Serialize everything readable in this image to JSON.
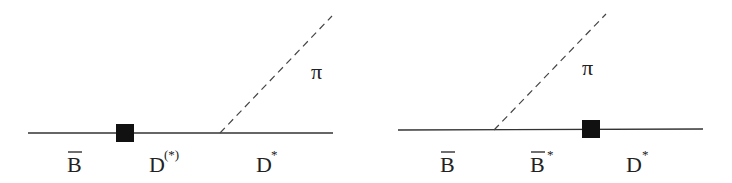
{
  "diagrams": [
    {
      "id": "left",
      "line": {
        "x1": 28,
        "x2": 333,
        "y": 133
      },
      "vertex": {
        "cx": 125,
        "cy": 133,
        "size": 18
      },
      "dashed": {
        "x1": 220,
        "y1": 133,
        "x2": 332,
        "y2": 16
      },
      "labels": {
        "pion": "π",
        "incoming": {
          "base": "B",
          "bar": true
        },
        "intermediate": {
          "base": "D",
          "sup": "(*)"
        },
        "outgoing": {
          "base": "D",
          "sup": "*"
        }
      }
    },
    {
      "id": "right",
      "line": {
        "x1": 398,
        "x2": 703,
        "y": 130
      },
      "vertex": {
        "cx": 591,
        "cy": 129,
        "size": 18
      },
      "dashed": {
        "x1": 494,
        "y1": 130,
        "x2": 606,
        "y2": 14
      },
      "labels": {
        "pion": "π",
        "incoming": {
          "base": "B",
          "bar": true
        },
        "intermediate": {
          "base": "B",
          "bar": true,
          "sup": "*"
        },
        "outgoing": {
          "base": "D",
          "sup": "*"
        }
      }
    }
  ],
  "colors": {
    "line": "#333333",
    "vertex": "#111111",
    "text": "#222222",
    "background": "#ffffff"
  }
}
